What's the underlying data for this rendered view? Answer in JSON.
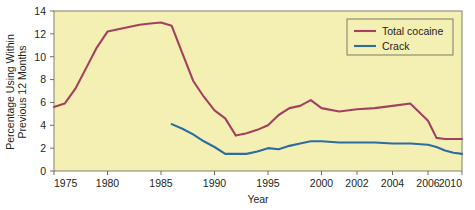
{
  "chart_data": {
    "type": "line",
    "title": "",
    "xlabel": "Year",
    "ylabel": "Percentage Using Within Previous 12 Months",
    "ylabel_line1": "Percentage Using Within",
    "ylabel_line2": "Previous 12 Months",
    "xlim": [
      1975,
      2010
    ],
    "ylim": [
      0,
      14
    ],
    "ytick_values": [
      0,
      2,
      4,
      6,
      8,
      10,
      12,
      14
    ],
    "ytick_labels": [
      "0",
      "2",
      "4",
      "6",
      "8",
      "10",
      "12",
      "14"
    ],
    "xtick_values": [
      1975,
      1980,
      1985,
      1990,
      1995,
      2000,
      2002,
      2004,
      2006,
      2010
    ],
    "xtick_labels": [
      "1975",
      "1980",
      "1985",
      "1990",
      "1995",
      "2000",
      "2002",
      "2004",
      "2006",
      "2010"
    ],
    "grid": false,
    "legend_position": "top-right",
    "plot_background": "#f4f0b4",
    "series": [
      {
        "name": "Total cocaine",
        "color": "#a4405f",
        "x": [
          1975,
          1976,
          1977,
          1978,
          1979,
          1980,
          1981,
          1982,
          1983,
          1984,
          1985,
          1986,
          1987,
          1988,
          1989,
          1990,
          1991,
          1992,
          1993,
          1994,
          1995,
          1996,
          1997,
          1998,
          1999,
          2000,
          2001,
          2002,
          2003,
          2004,
          2005,
          2006,
          2007,
          2008,
          2009,
          2010
        ],
        "values": [
          5.6,
          5.9,
          7.2,
          9.0,
          10.8,
          12.2,
          12.4,
          12.6,
          12.8,
          12.9,
          13.0,
          12.7,
          10.3,
          7.9,
          6.5,
          5.3,
          4.6,
          3.1,
          3.3,
          3.6,
          4.0,
          4.9,
          5.5,
          5.7,
          6.2,
          5.5,
          5.2,
          5.4,
          5.5,
          5.7,
          5.9,
          4.4,
          2.9,
          2.8,
          2.8,
          2.8
        ]
      },
      {
        "name": "Crack",
        "color": "#2d6ca2",
        "x": [
          1986,
          1987,
          1988,
          1989,
          1990,
          1991,
          1992,
          1993,
          1994,
          1995,
          1996,
          1997,
          1998,
          1999,
          2000,
          2001,
          2002,
          2003,
          2004,
          2005,
          2006,
          2007,
          2008,
          2009,
          2010
        ],
        "values": [
          4.1,
          3.7,
          3.2,
          2.6,
          2.1,
          1.5,
          1.5,
          1.5,
          1.7,
          2.0,
          1.9,
          2.2,
          2.4,
          2.6,
          2.6,
          2.5,
          2.5,
          2.5,
          2.4,
          2.4,
          2.3,
          2.1,
          1.8,
          1.6,
          1.5
        ]
      }
    ],
    "legend": [
      {
        "label": "Total cocaine",
        "color": "#a4405f"
      },
      {
        "label": "Crack",
        "color": "#2d6ca2"
      }
    ]
  }
}
